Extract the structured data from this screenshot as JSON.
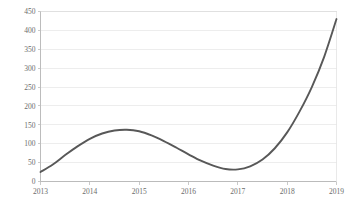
{
  "chart_data": {
    "type": "line",
    "title": "",
    "subtitle": "",
    "xlabel": "",
    "ylabel": "",
    "legend": [],
    "legend_position": "none",
    "grid": "horizontal",
    "xlim": [
      2013,
      2019
    ],
    "ylim": [
      0,
      450
    ],
    "x_tick_labels": [
      "2013",
      "2014",
      "2015",
      "2016",
      "2017",
      "2018",
      "2019"
    ],
    "x_ticks": [
      2013,
      2014,
      2015,
      2016,
      2017,
      2018,
      2019
    ],
    "y_tick_labels": [
      "0",
      "50",
      "100",
      "150",
      "200",
      "250",
      "300",
      "350",
      "400",
      "450"
    ],
    "y_ticks": [
      0,
      50,
      100,
      150,
      200,
      250,
      300,
      350,
      400,
      450
    ],
    "series": [
      {
        "name": "series-1",
        "color": "#585858",
        "x": [
          2013,
          2013.25,
          2013.5,
          2013.75,
          2014,
          2014.25,
          2014.5,
          2014.75,
          2015,
          2015.25,
          2015.5,
          2015.75,
          2016,
          2016.25,
          2016.5,
          2016.75,
          2017,
          2017.25,
          2017.5,
          2017.75,
          2018,
          2018.25,
          2018.5,
          2018.75,
          2019
        ],
        "values": [
          25,
          45,
          70,
          93,
          113,
          127,
          135,
          137,
          133,
          122,
          107,
          90,
          72,
          55,
          42,
          33,
          32,
          40,
          58,
          88,
          130,
          185,
          250,
          330,
          430
        ],
        "key_points": {
          "start": {
            "x": 2013,
            "y": 25
          },
          "local_max": {
            "x": 2014.8,
            "y": 137
          },
          "local_min": {
            "x": 2016.65,
            "y": 32
          },
          "end": {
            "x": 2019,
            "y": 430
          }
        }
      }
    ],
    "colors": {
      "line": "#585858",
      "gridline": "#e9e9e9",
      "axis": "#b5b5b5",
      "tick_text": "#6b6b6b",
      "background": "#ffffff"
    }
  }
}
